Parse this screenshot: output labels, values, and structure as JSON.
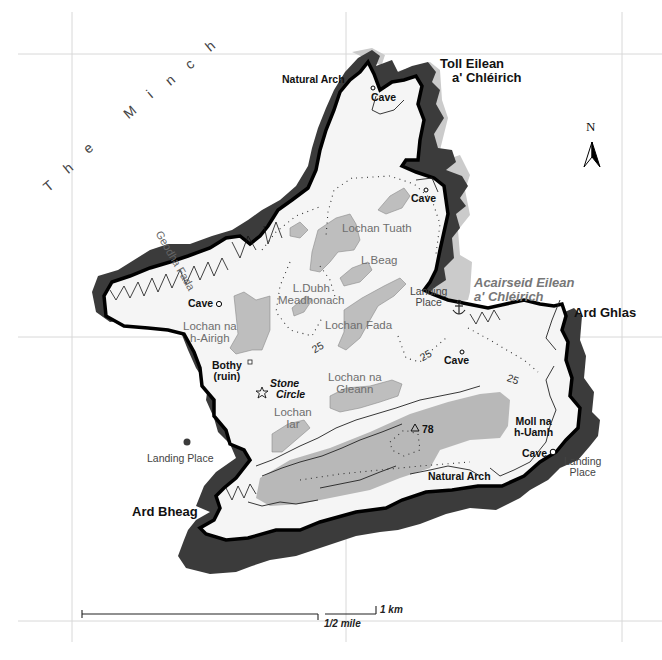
{
  "map": {
    "sea_name": "The Minch",
    "sea_letters": [
      "T",
      "h",
      "e",
      "M",
      "i",
      "n",
      "c",
      "h"
    ],
    "inlet": "Geodha Fada",
    "bay": {
      "line1": "Acairseid Eilean",
      "line2": "a' Chléirich"
    },
    "headlands": {
      "north": {
        "line1": "Toll Eilean",
        "line2": "a' Chléirich"
      },
      "east": "Ard Ghlas",
      "southwest": "Ard Bheag"
    },
    "features": {
      "natural_arch_north": "Natural Arch",
      "natural_arch_south": "Natural Arch",
      "cave_north": "Cave",
      "cave_northeast": "Cave",
      "cave_west": "Cave",
      "cave_east": "Cave",
      "cave_southeast": "Cave",
      "bothy": {
        "line1": "Bothy",
        "line2": "(ruin)"
      },
      "stone_circle": {
        "line1": "Stone",
        "line2": "Circle"
      },
      "moll": {
        "line1": "Moll na",
        "line2": "h-Uamh"
      },
      "summit_height": "78"
    },
    "landing_places": {
      "east_bay": {
        "line1": "Landing",
        "line2": "Place"
      },
      "southwest": "Landing Place",
      "southeast": {
        "line1": "Landing",
        "line2": "Place"
      }
    },
    "lochs": {
      "tuath": "Lochan Tuath",
      "beag": "L.Beag",
      "dubh": {
        "line1": "L.Dubh",
        "line2": "Meadhonach"
      },
      "airigh": {
        "line1": "Lochan na",
        "line2": "h-Airigh"
      },
      "fada": "Lochan Fada",
      "gleann": {
        "line1": "Lochan na",
        "line2": "Gleann"
      },
      "iar": {
        "line1": "Lochan",
        "line2": "Iar"
      }
    },
    "contours": [
      "25",
      "25",
      "25",
      "25"
    ],
    "north_arrow": "N",
    "scale": {
      "km": "1 km",
      "mile": "1/2 mile"
    },
    "colors": {
      "land": "#f4f4f4",
      "cliff": "#3a3a3a",
      "shore_shadow": "#c8c8c8",
      "lake": "#bdbdbd",
      "high_ground": "#b5b5b5",
      "coastline": "#000000",
      "grid": "#d6d6d6",
      "lake_text": "#6e6e6e"
    }
  }
}
